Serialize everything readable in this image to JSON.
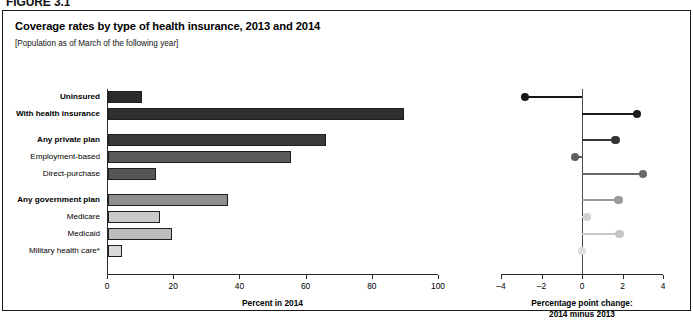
{
  "figure_label": "FIGURE 3.1",
  "panel": {
    "title": "Coverage rates by type of health insurance, 2013 and 2014",
    "subtitle": "[Population as of March of the following year]"
  },
  "chart_data": {
    "type": "bar",
    "title": "Coverage rates by type of health insurance, 2013 and 2014",
    "subtitle": "[Population as of March of the following year]",
    "categories": [
      "Uninsured",
      "With health insurance",
      "Any private plan",
      "Employment-based",
      "Direct-purchase",
      "Any government plan",
      "Medicare",
      "Medicaid",
      "Military health care*"
    ],
    "category_bold": [
      true,
      true,
      true,
      false,
      false,
      true,
      false,
      false,
      false
    ],
    "category_gap_before": [
      false,
      false,
      true,
      false,
      false,
      true,
      false,
      false,
      false
    ],
    "series": [
      {
        "name": "Percent in 2014",
        "panel": "left",
        "values": [
          10.4,
          89.6,
          66.0,
          55.4,
          14.6,
          36.5,
          16.0,
          19.5,
          4.5
        ]
      },
      {
        "name": "Percentage point change: 2014 minus 2013",
        "panel": "right",
        "values": [
          -2.8,
          2.7,
          1.65,
          -0.35,
          3.0,
          1.8,
          0.25,
          1.85,
          0.0
        ]
      }
    ],
    "bar_colors": [
      "#2b2b2b",
      "#2f2f2f",
      "#3a3a3a",
      "#5a5a5a",
      "#555555",
      "#8e8e8e",
      "#c9c9c9",
      "#bdbdbd",
      "#d9d9d9"
    ],
    "dot_colors": [
      "#151515",
      "#1c1c1c",
      "#343434",
      "#5e5e5e",
      "#6a6a6a",
      "#9a9a9a",
      "#d2d2d2",
      "#c6c6c6",
      "#dedede"
    ],
    "left_axis": {
      "xlabel": "Percent in 2014",
      "xlim": [
        0,
        100
      ],
      "ticks": [
        0,
        20,
        40,
        60,
        80,
        100
      ],
      "ticklabels": [
        "0",
        "20",
        "40",
        "60",
        "80",
        "100"
      ],
      "grid": false
    },
    "right_axis": {
      "xlabel_line1": "Percentage point change:",
      "xlabel_line2": "2014 minus 2013",
      "xlim": [
        -4,
        4
      ],
      "ticks": [
        -4,
        -2,
        0,
        2,
        4
      ],
      "ticklabels": [
        "–4",
        "–2",
        "0",
        "2",
        "4"
      ],
      "grid": false,
      "zero_reference_line": true
    },
    "legend_position": "none"
  }
}
